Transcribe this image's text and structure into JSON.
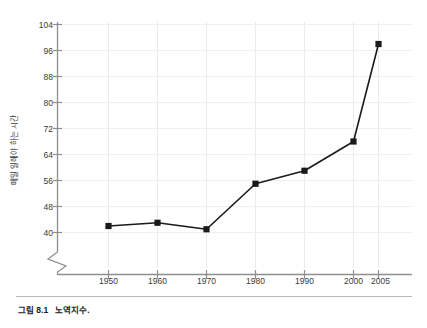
{
  "caption": {
    "figure_number": "그림 8.1",
    "text": "노역지수."
  },
  "chart_data": {
    "type": "line",
    "title": "",
    "subtitle": "",
    "xlabel": "",
    "ylabel": "매일 일해야 하는 시간",
    "x": [
      1950,
      1960,
      1970,
      1980,
      1990,
      2000,
      2005
    ],
    "categories": [
      "1950",
      "1960",
      "1970",
      "1980",
      "1990",
      "2000",
      "2005"
    ],
    "values": [
      42,
      43,
      41,
      55,
      59,
      68,
      98
    ],
    "series": [
      {
        "name": "노역지수",
        "values": [
          42,
          43,
          41,
          55,
          59,
          68,
          98
        ]
      }
    ],
    "xlim": [
      1945,
      2010
    ],
    "ylim": [
      36,
      104
    ],
    "yticks": [
      40,
      48,
      56,
      64,
      72,
      80,
      88,
      96,
      104
    ],
    "xticks": [
      "1950",
      "1960",
      "1970",
      "1980",
      "1990",
      "2000",
      "2005"
    ],
    "grid": true,
    "legend": "none",
    "marker": "square",
    "axis_break": true,
    "line_color": "#1a1a1a",
    "marker_color": "#1a1a1a",
    "grid_color": "#e8e8e8",
    "axis_color": "#8c8c8c"
  }
}
